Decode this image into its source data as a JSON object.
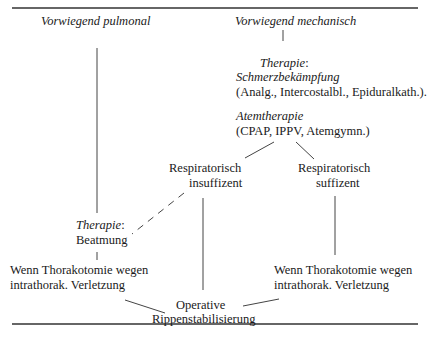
{
  "diagram": {
    "columns": {
      "left_header": "Vorwiegend pulmonal",
      "right_header": "Vorwiegend mechanisch"
    },
    "nodes": {
      "therapy_pain": {
        "label_italic": "Therapie",
        "label_suffix": ":",
        "title": "Schmerzbekämpfung",
        "detail": "(Analg., Intercostalbl., Epiduralkath.)."
      },
      "breathing_therapy": {
        "title": "Atemtherapie",
        "detail": "(CPAP, IPPV, Atemgymn.)"
      },
      "resp_insufficient": {
        "line1": "Respiratorisch",
        "line2": "insuffizent"
      },
      "resp_sufficient": {
        "line1": "Respiratorisch",
        "line2": "suffizent"
      },
      "therapy_ventilation": {
        "label_italic": "Therapie",
        "label_suffix": ":",
        "detail": "Beatmung"
      },
      "thoracotomy_left": {
        "line1": "Wenn Thorakotomie wegen",
        "line2": "intrathorak. Verletzung"
      },
      "thoracotomy_right": {
        "line1": "Wenn Thorakotomie wegen",
        "line2": "intrathorak. Verletzung"
      },
      "operative": {
        "line1": "Operative",
        "line2": "Rippenstabilisierung"
      }
    },
    "edges": [
      {
        "from": "Vorwiegend pulmonal",
        "to": "Therapie: Beatmung",
        "style": "solid"
      },
      {
        "from": "Vorwiegend mechanisch",
        "to": "Therapie: Schmerzbekämpfung",
        "style": "solid"
      },
      {
        "from": "Atemtherapie",
        "to": "Respiratorisch insuffizent",
        "style": "solid"
      },
      {
        "from": "Atemtherapie",
        "to": "Respiratorisch suffizent",
        "style": "solid"
      },
      {
        "from": "Respiratorisch insuffizent",
        "to": "Therapie: Beatmung",
        "style": "dashed"
      },
      {
        "from": "Respiratorisch insuffizent",
        "to": "Operative Rippenstabilisierung",
        "style": "solid"
      },
      {
        "from": "Respiratorisch suffizent",
        "to": "Wenn Thorakotomie (rechts)",
        "style": "solid"
      },
      {
        "from": "Therapie: Beatmung",
        "to": "Wenn Thorakotomie (links)",
        "style": "solid"
      },
      {
        "from": "Wenn Thorakotomie (links)",
        "to": "Operative Rippenstabilisierung",
        "style": "solid"
      },
      {
        "from": "Wenn Thorakotomie (rechts)",
        "to": "Operative Rippenstabilisierung",
        "style": "solid"
      }
    ],
    "line_color": "#333333"
  }
}
